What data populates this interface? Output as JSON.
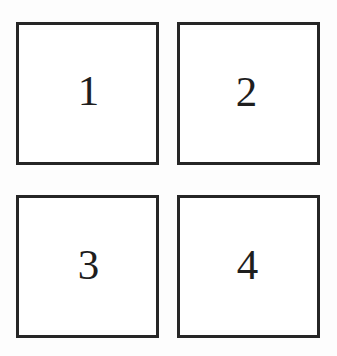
{
  "figure": {
    "background_color": "#fdfdfd",
    "box_fill_color": "#ffffff",
    "box_border_color": "#262626",
    "label_color": "#1e1e1e",
    "columns": 2,
    "rows": 2,
    "boxes": [
      {
        "label": "1",
        "position": "top-left"
      },
      {
        "label": "2",
        "position": "top-right"
      },
      {
        "label": "3",
        "position": "bottom-left"
      },
      {
        "label": "4",
        "position": "bottom-right"
      }
    ]
  }
}
